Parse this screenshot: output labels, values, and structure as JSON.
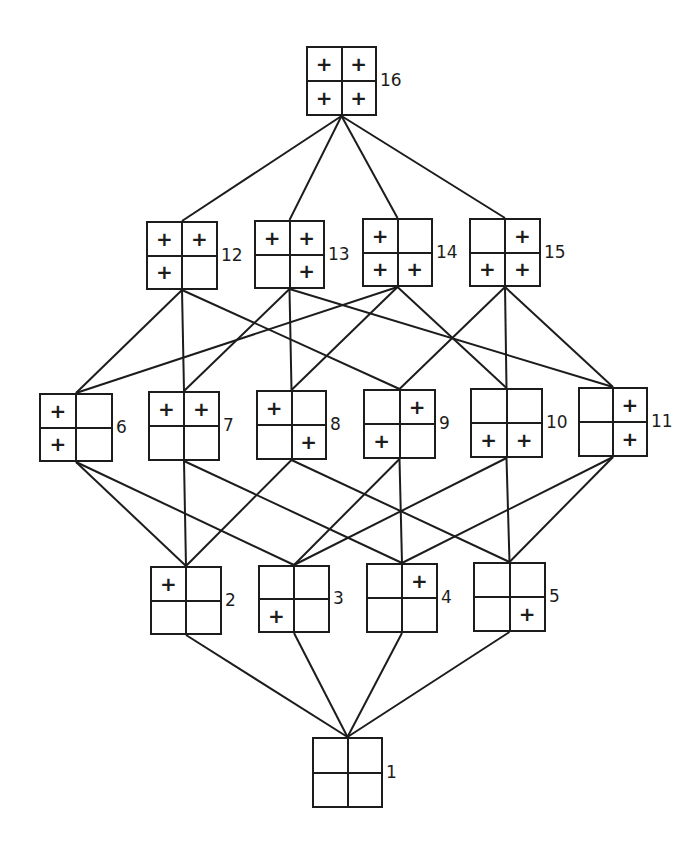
{
  "diagram": {
    "type": "lattice",
    "line_color": "#1c1c1c",
    "mark_symbol": "+",
    "nodes": [
      {
        "id": "16",
        "label": "16",
        "cells": [
          "+",
          "+",
          "+",
          "+"
        ],
        "x": 306,
        "y": 46,
        "w": 71,
        "h": 70
      },
      {
        "id": "12",
        "label": "12",
        "cells": [
          "+",
          "+",
          "+",
          ""
        ],
        "x": 146,
        "y": 221,
        "w": 72,
        "h": 69
      },
      {
        "id": "13",
        "label": "13",
        "cells": [
          "+",
          "+",
          "",
          "+"
        ],
        "x": 254,
        "y": 220,
        "w": 71,
        "h": 69
      },
      {
        "id": "14",
        "label": "14",
        "cells": [
          "+",
          "",
          "+",
          "+"
        ],
        "x": 362,
        "y": 218,
        "w": 71,
        "h": 69
      },
      {
        "id": "15",
        "label": "15",
        "cells": [
          "",
          "+",
          "+",
          "+"
        ],
        "x": 469,
        "y": 218,
        "w": 72,
        "h": 69
      },
      {
        "id": "6",
        "label": "6",
        "cells": [
          "+",
          "",
          "+",
          ""
        ],
        "x": 39,
        "y": 393,
        "w": 74,
        "h": 69
      },
      {
        "id": "7",
        "label": "7",
        "cells": [
          "+",
          "+",
          "",
          ""
        ],
        "x": 148,
        "y": 391,
        "w": 72,
        "h": 70
      },
      {
        "id": "8",
        "label": "8",
        "cells": [
          "+",
          "",
          "",
          "+"
        ],
        "x": 256,
        "y": 390,
        "w": 71,
        "h": 70
      },
      {
        "id": "9",
        "label": "9",
        "cells": [
          "",
          "+",
          "+",
          ""
        ],
        "x": 363,
        "y": 389,
        "w": 73,
        "h": 70
      },
      {
        "id": "10",
        "label": "10",
        "cells": [
          "",
          "",
          "+",
          "+"
        ],
        "x": 470,
        "y": 388,
        "w": 73,
        "h": 70
      },
      {
        "id": "11",
        "label": "11",
        "cells": [
          "",
          "+",
          "",
          "+"
        ],
        "x": 578,
        "y": 387,
        "w": 70,
        "h": 70
      },
      {
        "id": "2",
        "label": "2",
        "cells": [
          "+",
          "",
          "",
          ""
        ],
        "x": 150,
        "y": 566,
        "w": 72,
        "h": 69
      },
      {
        "id": "3",
        "label": "3",
        "cells": [
          "",
          "",
          "+",
          ""
        ],
        "x": 258,
        "y": 565,
        "w": 72,
        "h": 68
      },
      {
        "id": "4",
        "label": "4",
        "cells": [
          "",
          "+",
          "",
          ""
        ],
        "x": 366,
        "y": 563,
        "w": 72,
        "h": 70
      },
      {
        "id": "5",
        "label": "5",
        "cells": [
          "",
          "",
          "",
          "+"
        ],
        "x": 473,
        "y": 562,
        "w": 73,
        "h": 70
      },
      {
        "id": "1",
        "label": "1",
        "cells": [
          "",
          "",
          "",
          ""
        ],
        "x": 312,
        "y": 737,
        "w": 71,
        "h": 71
      }
    ],
    "edges": [
      [
        "16",
        "12"
      ],
      [
        "16",
        "13"
      ],
      [
        "16",
        "14"
      ],
      [
        "16",
        "15"
      ],
      [
        "12",
        "6"
      ],
      [
        "12",
        "7"
      ],
      [
        "12",
        "9"
      ],
      [
        "13",
        "7"
      ],
      [
        "13",
        "8"
      ],
      [
        "13",
        "11"
      ],
      [
        "14",
        "6"
      ],
      [
        "14",
        "8"
      ],
      [
        "14",
        "10"
      ],
      [
        "15",
        "9"
      ],
      [
        "15",
        "10"
      ],
      [
        "15",
        "11"
      ],
      [
        "6",
        "2"
      ],
      [
        "6",
        "3"
      ],
      [
        "7",
        "2"
      ],
      [
        "7",
        "4"
      ],
      [
        "8",
        "2"
      ],
      [
        "8",
        "5"
      ],
      [
        "9",
        "3"
      ],
      [
        "9",
        "4"
      ],
      [
        "10",
        "3"
      ],
      [
        "10",
        "5"
      ],
      [
        "11",
        "4"
      ],
      [
        "11",
        "5"
      ],
      [
        "2",
        "1"
      ],
      [
        "3",
        "1"
      ],
      [
        "4",
        "1"
      ],
      [
        "5",
        "1"
      ]
    ]
  }
}
